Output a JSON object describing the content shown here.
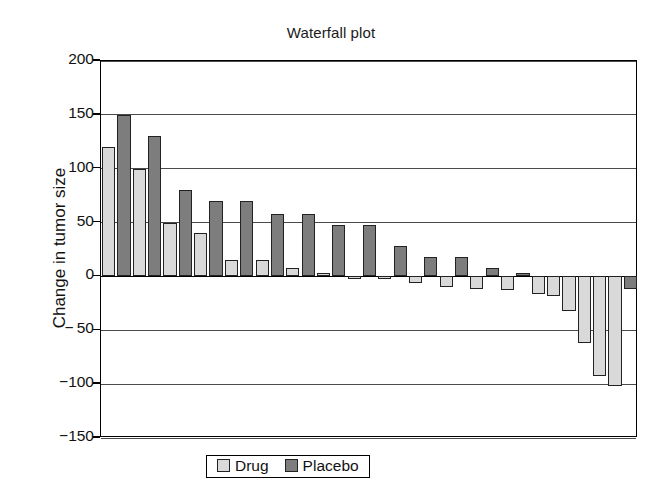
{
  "chart_data": {
    "type": "bar",
    "title": "Waterfall plot",
    "xlabel": "",
    "ylabel": "Change in tumor size",
    "ylim": [
      -150,
      200
    ],
    "yticks": [
      200,
      150,
      100,
      50,
      0,
      -50,
      -100,
      -150
    ],
    "ytick_labels": [
      "200",
      "150",
      "100",
      "50",
      "0",
      "− 50",
      "−100",
      "−150"
    ],
    "grid": true,
    "legend": {
      "position": "bottom-center",
      "entries": [
        {
          "name": "Drug",
          "color": "#d9d9d9"
        },
        {
          "name": "Placebo",
          "color": "#7d7d7d"
        }
      ]
    },
    "categories": [
      "1",
      "2",
      "3",
      "4",
      "5",
      "6",
      "7",
      "8",
      "9",
      "10",
      "11",
      "12",
      "13",
      "14",
      "15",
      "16",
      "17",
      "18",
      "19",
      "20",
      "21",
      "22",
      "23",
      "24",
      "25",
      "26",
      "27",
      "28",
      "29",
      "30",
      "31",
      "32",
      "33",
      "34",
      "35"
    ],
    "values": [
      120,
      150,
      100,
      130,
      50,
      80,
      40,
      70,
      15,
      70,
      15,
      58,
      8,
      58,
      3,
      48,
      -1,
      48,
      -2,
      28,
      -6,
      18,
      -10,
      18,
      -12,
      8,
      -13,
      3,
      -16,
      -18,
      -32,
      -62,
      -92,
      -102,
      -12
    ],
    "groups": [
      "Drug",
      "Placebo",
      "Drug",
      "Placebo",
      "Drug",
      "Placebo",
      "Drug",
      "Placebo",
      "Drug",
      "Placebo",
      "Drug",
      "Placebo",
      "Drug",
      "Placebo",
      "Drug",
      "Placebo",
      "Drug",
      "Placebo",
      "Drug",
      "Placebo",
      "Drug",
      "Placebo",
      "Drug",
      "Placebo",
      "Drug",
      "Placebo",
      "Drug",
      "Placebo",
      "Drug",
      "Drug",
      "Drug",
      "Drug",
      "Drug",
      "Drug",
      "Placebo"
    ]
  }
}
